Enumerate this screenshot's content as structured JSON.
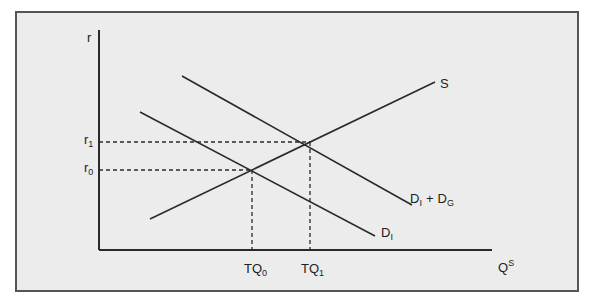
{
  "diagram": {
    "type": "supply-demand",
    "axes": {
      "y_label": "r",
      "x_label_base": "Q",
      "x_label_sup": "S"
    },
    "curves": {
      "supply": {
        "label": "S"
      },
      "demand_total": {
        "label_base1": "D",
        "label_sub1": "I",
        "plus": "+",
        "label_base2": "D",
        "label_sub2": "G"
      },
      "demand_investment": {
        "label_base": "D",
        "label_sub": "I"
      }
    },
    "equilibria": [
      {
        "r_base": "r",
        "r_sub": "0",
        "q_base": "TQ",
        "q_sub": "0"
      },
      {
        "r_base": "r",
        "r_sub": "1",
        "q_base": "TQ",
        "q_sub": "1"
      }
    ],
    "colors": {
      "background": "#ececec",
      "line": "#2a2a2a",
      "frame": "#555555"
    }
  }
}
